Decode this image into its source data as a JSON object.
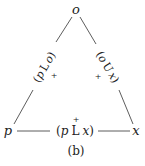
{
  "diagram": {
    "vertices": {
      "top": "o",
      "left": "p",
      "right": "x"
    },
    "edges": {
      "left": {
        "open": "(",
        "a": "p",
        "op": "L",
        "b": "o",
        "close": ")",
        "mark": "+"
      },
      "right": {
        "open": "(",
        "a": "o",
        "op": "U",
        "b": "x",
        "close": ")",
        "mark": "+"
      },
      "bottom": {
        "open": "(",
        "a": "p",
        "op": "L",
        "b": "x",
        "close": ")",
        "mark": "+"
      }
    },
    "caption": "(b)",
    "line_color": "#333333"
  }
}
